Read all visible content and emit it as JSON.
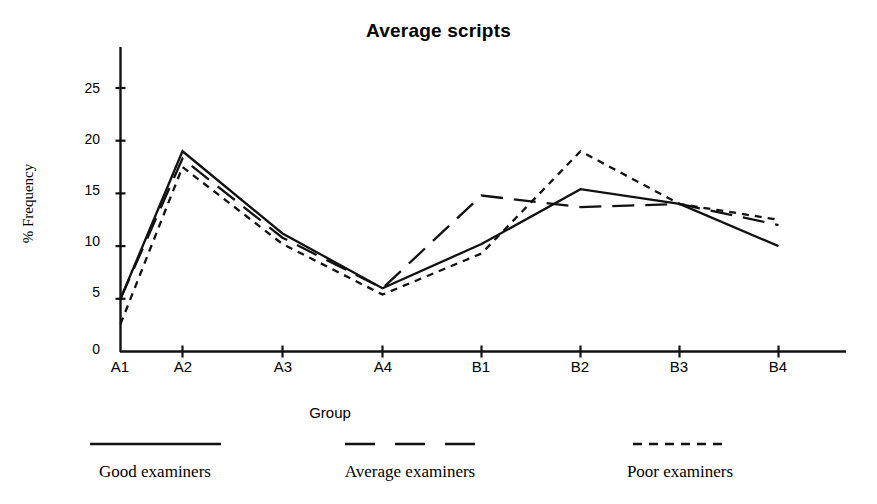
{
  "chart_data": {
    "type": "line",
    "title": "Average scripts",
    "xlabel": "Group",
    "ylabel": "% Frequency",
    "categories": [
      "A1",
      "A2",
      "A3",
      "A4",
      "B1",
      "B2",
      "B3",
      "B4"
    ],
    "ylim": [
      0,
      27
    ],
    "yticks": [
      0,
      5,
      10,
      15,
      20,
      25
    ],
    "grid": false,
    "legend_position": "bottom",
    "series": [
      {
        "name": "Good examiners",
        "style": "solid",
        "values": [
          5.0,
          19.0,
          11.2,
          6.0,
          10.2,
          15.4,
          14.0,
          10.0
        ]
      },
      {
        "name": "Average examiners",
        "style": "long-dash",
        "values": [
          5.0,
          18.3,
          10.8,
          6.0,
          14.8,
          13.7,
          14.0,
          12.0
        ]
      },
      {
        "name": "Poor examiners",
        "style": "short-dash",
        "values": [
          2.6,
          17.5,
          10.2,
          5.4,
          9.3,
          19.0,
          14.0,
          12.5
        ]
      }
    ]
  },
  "legend": [
    {
      "label": "Good examiners",
      "style": "solid"
    },
    {
      "label": "Average examiners",
      "style": "long-dash"
    },
    {
      "label": "Poor examiners",
      "style": "short-dash"
    }
  ],
  "axis": {
    "ytick_labels": [
      "25",
      "20",
      "15",
      "10",
      "5",
      "0"
    ],
    "xtick_labels": [
      "A1",
      "A2",
      "A3",
      "A4",
      "B1",
      "B2",
      "B3",
      "B4"
    ]
  }
}
